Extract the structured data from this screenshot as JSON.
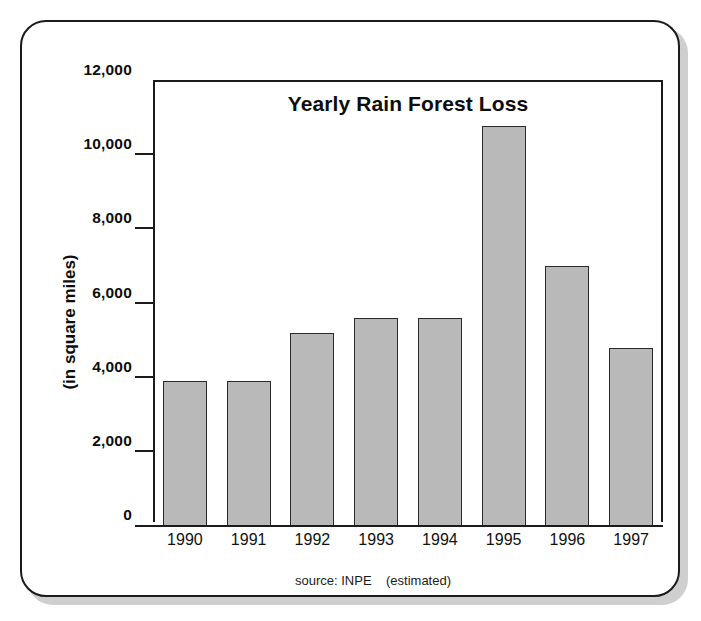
{
  "card": {
    "border_color": "#1b1b1b",
    "background": "#ffffff"
  },
  "chart_data": {
    "type": "bar",
    "title": "Yearly Rain Forest Loss",
    "xlabel": "",
    "ylabel": "(in square miles)",
    "categories": [
      "1990",
      "1991",
      "1992",
      "1993",
      "1994",
      "1995",
      "1996",
      "1997"
    ],
    "values": [
      3900,
      3900,
      5200,
      5600,
      5600,
      10800,
      7000,
      4800
    ],
    "ylim": [
      0,
      12000
    ],
    "ytick_labels": [
      "12,000",
      "10,000",
      "8,000",
      "6,000",
      "4,000",
      "2,000",
      "0"
    ],
    "ytick_values": [
      12000,
      10000,
      8000,
      6000,
      4000,
      2000,
      0
    ],
    "grid": false,
    "legend": "none",
    "bar_fill_color": "#b9b9b9",
    "bar_border_color": "#2a2a2a",
    "source_note": "source: INPE    (estimated)"
  }
}
